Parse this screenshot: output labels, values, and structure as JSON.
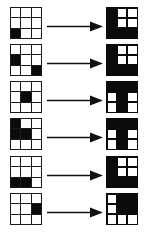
{
  "figure": {
    "background_color": "#ffffff",
    "fill_color": "#0b0b0b",
    "grid_line_color": "#1a1a1a",
    "cell_states": {
      "filled": "black",
      "empty": "white"
    },
    "arrow_label": "transforms-to",
    "rows_count": 6,
    "rows": [
      {
        "index": 1,
        "input": {
          "name": "input-grid-1",
          "cells": [
            [
              0,
              0,
              0
            ],
            [
              0,
              0,
              0
            ],
            [
              1,
              0,
              0
            ]
          ]
        },
        "output": {
          "name": "output-grid-1",
          "cells": [
            [
              1,
              0,
              0
            ],
            [
              1,
              0,
              0
            ],
            [
              1,
              1,
              1
            ]
          ]
        }
      },
      {
        "index": 2,
        "input": {
          "name": "input-grid-2",
          "cells": [
            [
              0,
              0,
              0
            ],
            [
              1,
              0,
              0
            ],
            [
              0,
              0,
              1
            ]
          ]
        },
        "output": {
          "name": "output-grid-2",
          "cells": [
            [
              1,
              0,
              0
            ],
            [
              1,
              0,
              0
            ],
            [
              1,
              1,
              1
            ]
          ]
        }
      },
      {
        "index": 3,
        "input": {
          "name": "input-grid-3",
          "cells": [
            [
              0,
              0,
              0
            ],
            [
              0,
              1,
              0
            ],
            [
              0,
              0,
              0
            ]
          ]
        },
        "output": {
          "name": "output-grid-3",
          "cells": [
            [
              1,
              1,
              1
            ],
            [
              0,
              1,
              0
            ],
            [
              0,
              1,
              0
            ]
          ]
        }
      },
      {
        "index": 4,
        "input": {
          "name": "input-grid-4",
          "cells": [
            [
              1,
              0,
              0
            ],
            [
              1,
              1,
              0
            ],
            [
              0,
              0,
              0
            ]
          ]
        },
        "output": {
          "name": "output-grid-4",
          "cells": [
            [
              1,
              1,
              1
            ],
            [
              0,
              1,
              0
            ],
            [
              0,
              1,
              0
            ]
          ]
        }
      },
      {
        "index": 5,
        "input": {
          "name": "input-grid-5",
          "cells": [
            [
              0,
              0,
              0
            ],
            [
              0,
              0,
              0
            ],
            [
              1,
              1,
              0
            ]
          ]
        },
        "output": {
          "name": "output-grid-5",
          "cells": [
            [
              1,
              0,
              0
            ],
            [
              1,
              0,
              0
            ],
            [
              1,
              1,
              1
            ]
          ]
        }
      },
      {
        "index": 6,
        "input": {
          "name": "input-grid-6",
          "cells": [
            [
              0,
              0,
              0
            ],
            [
              0,
              0,
              1
            ],
            [
              0,
              0,
              0
            ]
          ]
        },
        "output": {
          "name": "output-grid-6",
          "cells": [
            [
              0,
              1,
              1
            ],
            [
              0,
              1,
              1
            ],
            [
              0,
              0,
              0
            ]
          ]
        }
      }
    ]
  }
}
